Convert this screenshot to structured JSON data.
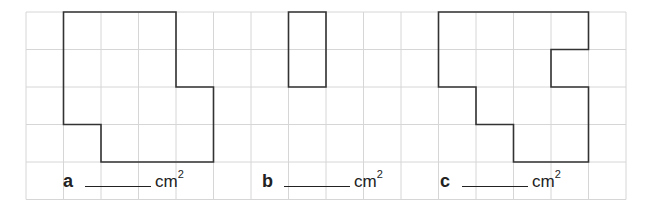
{
  "grid": {
    "cols": 16,
    "rows": 5,
    "left": 26,
    "top": 12,
    "cell": 37.5,
    "line_color": "#d6d6d6",
    "shape_color": "#333333"
  },
  "shapes": [
    {
      "label": "a",
      "points": [
        [
          1,
          0
        ],
        [
          4,
          0
        ],
        [
          4,
          2
        ],
        [
          5,
          2
        ],
        [
          5,
          4
        ],
        [
          2,
          4
        ],
        [
          2,
          3
        ],
        [
          1,
          3
        ]
      ]
    },
    {
      "label": "b",
      "points": [
        [
          7,
          0
        ],
        [
          8,
          0
        ],
        [
          8,
          2
        ],
        [
          7,
          2
        ]
      ]
    },
    {
      "label": "c",
      "points": [
        [
          11,
          0
        ],
        [
          15,
          0
        ],
        [
          15,
          1
        ],
        [
          14,
          1
        ],
        [
          14,
          2
        ],
        [
          15,
          2
        ],
        [
          15,
          4
        ],
        [
          13,
          4
        ],
        [
          13,
          3
        ],
        [
          12,
          3
        ],
        [
          12,
          2
        ],
        [
          11,
          2
        ]
      ]
    }
  ],
  "answers": [
    {
      "letter": "a",
      "unit": "cm",
      "exponent": "2"
    },
    {
      "letter": "b",
      "unit": "cm",
      "exponent": "2"
    },
    {
      "letter": "c",
      "unit": "cm",
      "exponent": "2"
    }
  ]
}
